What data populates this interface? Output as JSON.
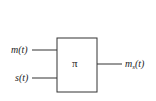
{
  "diagram": {
    "block": {
      "label": "π"
    },
    "inputs": [
      {
        "id": "m",
        "label": "m(t)"
      },
      {
        "id": "s",
        "label": "s(t)"
      }
    ],
    "output": {
      "base": "m",
      "subscript": "s",
      "arg": "(t)"
    },
    "colors": {
      "stroke": "#333333",
      "background": "#ffffff"
    }
  }
}
